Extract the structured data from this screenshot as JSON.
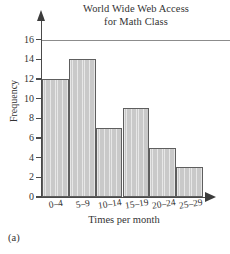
{
  "figure": {
    "part_label": "(a)"
  },
  "chart_data": {
    "type": "bar",
    "title": "World Wide Web Access for Math Class",
    "title_lines": [
      "World Wide Web Access",
      "for Math Class"
    ],
    "xlabel": "Times per month",
    "ylabel": "Frequency",
    "categories": [
      "0–4",
      "5–9",
      "10–14",
      "15–19",
      "20–24",
      "25–29"
    ],
    "values": [
      12,
      14,
      7,
      9,
      5,
      3
    ],
    "ylim": [
      0,
      16
    ],
    "ytick_values": [
      0,
      2,
      4,
      6,
      8,
      10,
      12,
      14,
      16
    ],
    "ytick_labels": [
      "0",
      "2",
      "4",
      "6",
      "8",
      "10",
      "12",
      "14",
      "16"
    ],
    "grid": false,
    "reference_line_y": 16,
    "legend": null,
    "bar_fill_color": "#c9c9c9",
    "bar_edge_color": "#5e5e5e",
    "axis_color": "#4a4a4a",
    "text_color": "#333333"
  }
}
